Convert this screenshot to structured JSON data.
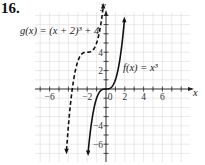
{
  "problem_number": "16.",
  "labels": {
    "g": "g(x) = (x + 2)³ + 4",
    "f": "f(x) = x³",
    "x_axis": "x",
    "y_axis": "y",
    "origin": "0"
  },
  "chart_data": {
    "type": "line",
    "title": "",
    "xlabel": "x",
    "ylabel": "y",
    "xlim": [
      -8,
      8
    ],
    "ylim": [
      -8,
      8
    ],
    "grid": true,
    "x_ticks": [
      -6,
      -4,
      -2,
      0,
      2,
      4,
      6
    ],
    "x_tick_labels": [
      "-6",
      "-2",
      "0",
      "2",
      "4",
      "6"
    ],
    "y_ticks": [
      -6,
      -4,
      -2,
      2,
      4,
      6
    ],
    "y_tick_labels": [
      "-6",
      "-4",
      "2",
      "4"
    ],
    "series": [
      {
        "name": "f(x) = x³",
        "style": "solid",
        "x": [
          -1.9,
          -1.5,
          -1,
          -0.5,
          0,
          0.5,
          1,
          1.5,
          1.95
        ],
        "y": [
          -6.86,
          -3.38,
          -1,
          -0.13,
          0,
          0.13,
          1,
          3.38,
          7.41
        ]
      },
      {
        "name": "g(x) = (x + 2)³ + 4",
        "style": "dashed",
        "x": [
          -4.2,
          -4,
          -3.5,
          -3,
          -2.5,
          -2,
          -1.5,
          -1,
          -0.3
        ],
        "y": [
          -6.65,
          -4,
          0.63,
          3,
          3.88,
          4,
          4.13,
          5,
          8.91
        ]
      }
    ],
    "annotations": [
      "g(x) = (x + 2)³ + 4",
      "f(x) = x³"
    ]
  }
}
